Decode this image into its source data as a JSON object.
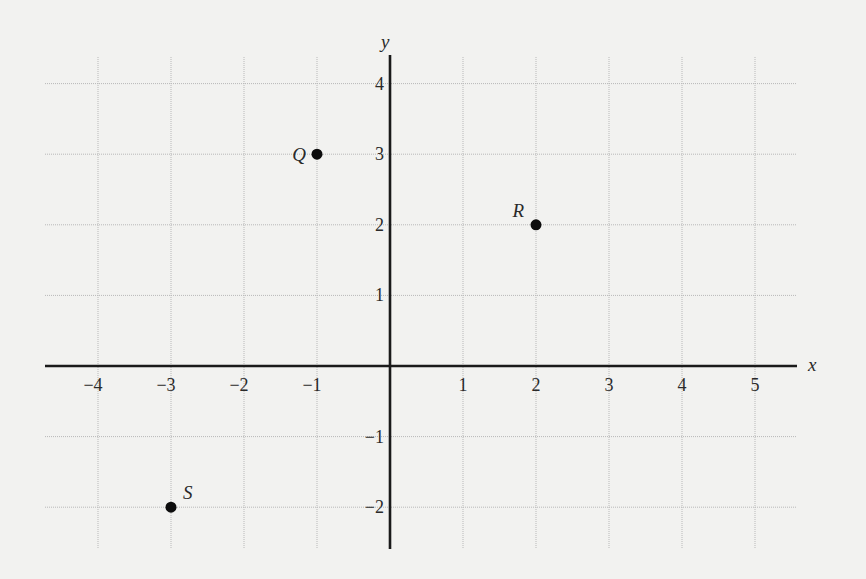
{
  "chart_data": {
    "type": "scatter",
    "title": "",
    "xlabel": "x",
    "ylabel": "y",
    "xlim": [
      -4.7,
      5.6
    ],
    "ylim": [
      -2.6,
      4.4
    ],
    "grid": true,
    "x_ticks": [
      -4,
      -3,
      -2,
      -1,
      1,
      2,
      3,
      4,
      5
    ],
    "x_tick_labels": [
      "−4",
      "−3",
      "−2",
      "−1",
      "1",
      "2",
      "3",
      "4",
      "5"
    ],
    "y_ticks": [
      4,
      3,
      2,
      1,
      -1,
      -2
    ],
    "y_tick_labels": [
      "4",
      "3",
      "2",
      "1",
      "−1",
      "−2"
    ],
    "points": [
      {
        "label": "Q",
        "x": -1,
        "y": 3,
        "label_pos": "left"
      },
      {
        "label": "R",
        "x": 2,
        "y": 2,
        "label_pos": "upper-left"
      },
      {
        "label": "S",
        "x": -3,
        "y": -2,
        "label_pos": "upper-right"
      }
    ],
    "legend": null
  },
  "colors": {
    "background": "#f2f2f0",
    "axis": "#1a1a1a",
    "grid": "#b8b8b8",
    "point": "#0d0d0d"
  }
}
